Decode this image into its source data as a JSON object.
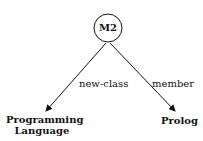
{
  "diagram": {
    "root": {
      "label": "M2",
      "shape": "circle"
    },
    "children": [
      {
        "label_line1": "Programming",
        "label_line2": "Language",
        "edge_label": "new-class"
      },
      {
        "label": "Prolog",
        "edge_label": "member"
      }
    ],
    "colors": {
      "stroke": "#111111",
      "background": "#ffffff"
    }
  }
}
